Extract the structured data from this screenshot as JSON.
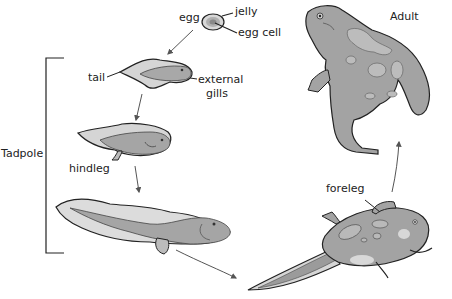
{
  "labels": {
    "egg": "egg",
    "jelly": "jelly",
    "egg_cell": "egg cell",
    "tail": "tail",
    "external_gills_1": "external",
    "external_gills_2": "gills",
    "tadpole": "Tadpole",
    "hindleg": "hindleg",
    "foreleg": "foreleg",
    "adult": "Adult"
  },
  "stages": [
    "egg",
    "tadpole with external gills",
    "tadpole with hindlegs",
    "larger tadpole",
    "froglet with forelegs",
    "adult frog"
  ],
  "colors": {
    "outline": "#222222",
    "body_dark": "#8f8f8f",
    "body_mid": "#a9a9a9",
    "body_light": "#cfcfcf",
    "fin": "#dcdcdc",
    "spot": "#b9b9b9",
    "arrow": "#555555"
  }
}
